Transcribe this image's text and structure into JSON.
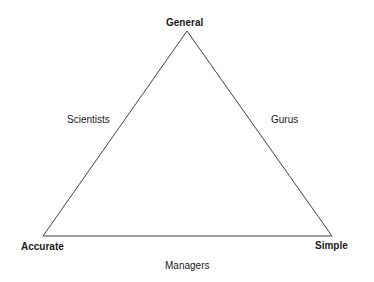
{
  "diagram": {
    "type": "triangle",
    "vertices": {
      "top": {
        "label": "General",
        "x": 187,
        "y": 31
      },
      "bottom_left": {
        "label": "Accurate",
        "x": 43,
        "y": 236
      },
      "bottom_right": {
        "label": "Simple",
        "x": 332,
        "y": 236
      }
    },
    "edges": {
      "left": {
        "label": "Scientists"
      },
      "right": {
        "label": "Gurus"
      },
      "bottom": {
        "label": "Managers"
      }
    },
    "line_color": "#444444"
  }
}
